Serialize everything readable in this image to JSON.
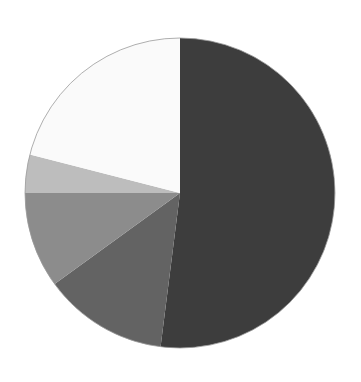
{
  "chart_data": {
    "type": "pie",
    "title": "",
    "start_angle_deg": 0,
    "direction": "clockwise",
    "labels": [
      "Slice 1",
      "Slice 2",
      "Slice 3",
      "Slice 4",
      "Slice 5"
    ],
    "values": [
      52,
      13,
      10,
      4,
      21
    ],
    "colors": [
      "#3d3d3d",
      "#636363",
      "#8c8c8c",
      "#bdbdbd",
      "#fafafa"
    ],
    "legend": "none",
    "center": [
      180,
      193
    ],
    "radius": 155,
    "outline_color": "#9a9a9a"
  }
}
